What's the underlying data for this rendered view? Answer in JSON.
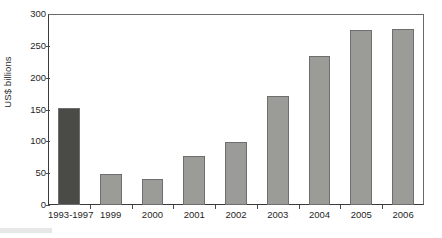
{
  "figure": {
    "y_axis_title": "US$ billions",
    "bar_color_default": "#9b9b98",
    "bar_color_highlight": "#4a4a47",
    "bar_border_color": "#6e6e6e",
    "axis_color": "#3a3a3a"
  },
  "chart_data": {
    "type": "bar",
    "title": "",
    "xlabel": "",
    "ylabel": "US$ billions",
    "ylim": [
      0,
      300
    ],
    "yticks": [
      0,
      50,
      100,
      150,
      200,
      250,
      300
    ],
    "ytick_labels": [
      "0",
      "50",
      "100",
      "150",
      "200",
      "250",
      "300"
    ],
    "grid": false,
    "legend": null,
    "categories": [
      "1993-1997",
      "1999",
      "2000",
      "2001",
      "2002",
      "2003",
      "2004",
      "2005",
      "2006"
    ],
    "values": [
      152,
      49,
      41,
      77,
      99,
      171,
      234,
      275,
      276
    ],
    "bar_colors": [
      "#4a4a47",
      "#9b9b98",
      "#9b9b98",
      "#9b9b98",
      "#9b9b98",
      "#9b9b98",
      "#9b9b98",
      "#9b9b98",
      "#9b9b98"
    ],
    "series": [
      {
        "name": "US$ billions",
        "values": [
          152,
          49,
          41,
          77,
          99,
          171,
          234,
          275,
          276
        ]
      }
    ]
  }
}
